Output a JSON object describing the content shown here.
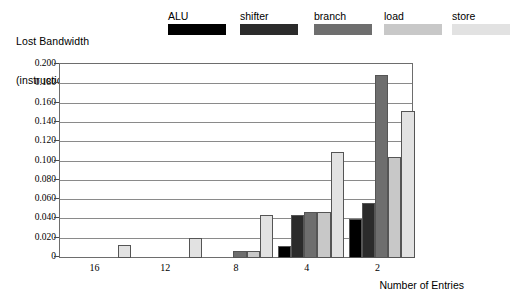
{
  "chart_data": {
    "type": "bar",
    "title": "",
    "ylabel_lines": [
      "Lost Bandwidth",
      "(instructions/cycle"
    ],
    "xlabel": "Number of Entries",
    "categories": [
      "16",
      "12",
      "8",
      "4",
      "2"
    ],
    "ylim": [
      0,
      0.2
    ],
    "ytick_labels": [
      "0.200",
      "0.180",
      "0.160",
      "0.140",
      "0.120",
      "0.100",
      "0.080",
      "0.060",
      "0.040",
      "0.020",
      "0"
    ],
    "ytick_values": [
      0.2,
      0.18,
      0.16,
      0.14,
      0.12,
      0.1,
      0.08,
      0.06,
      0.04,
      0.02,
      0
    ],
    "grid": true,
    "legend_position": "top",
    "series": [
      {
        "name": "ALU",
        "color": "#000000",
        "values": [
          0,
          0,
          0,
          0.012,
          0.04
        ]
      },
      {
        "name": "shifter",
        "color": "#2b2b2b",
        "values": [
          0,
          0,
          0,
          0.045,
          0.057
        ]
      },
      {
        "name": "branch",
        "color": "#6e6e6e",
        "values": [
          0,
          0,
          0.007,
          0.048,
          0.19
        ]
      },
      {
        "name": "load",
        "color": "#c8c8c8",
        "values": [
          0,
          0,
          0.007,
          0.048,
          0.105
        ]
      },
      {
        "name": "store",
        "color": "#e2e2e2",
        "values": [
          0.013,
          0.021,
          0.045,
          0.11,
          0.152
        ]
      }
    ]
  }
}
